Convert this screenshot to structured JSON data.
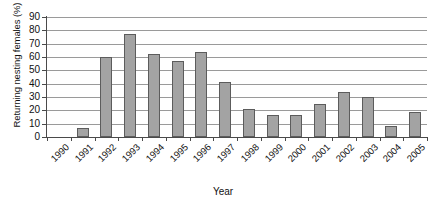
{
  "chart_data": {
    "type": "bar",
    "title": "",
    "xlabel": "Year",
    "ylabel": "Returning nesting females (%)",
    "categories": [
      "1990",
      "1991",
      "1992",
      "1993",
      "1994",
      "1995",
      "1996",
      "1997",
      "1998",
      "1999",
      "2000",
      "2001",
      "2002",
      "2003",
      "2004",
      "2005"
    ],
    "values": [
      0,
      7,
      60,
      77,
      62,
      57,
      63.5,
      41,
      21,
      16.5,
      16.5,
      25,
      33.5,
      30,
      8.5,
      18.5
    ],
    "ylim": [
      0,
      90
    ],
    "ytick_labels": [
      "90",
      "80",
      "70",
      "60",
      "50",
      "40",
      "30",
      "20",
      "10",
      "0"
    ],
    "ytick_values": [
      90,
      80,
      70,
      60,
      50,
      40,
      30,
      20,
      10,
      0
    ],
    "ytick_step": 10,
    "grid": true,
    "legend": false,
    "bar_color": "#a3a3a3",
    "bar_border_color": "#5c5c5c",
    "gridline_color": "#9a9a9a",
    "axis_color": "#4a4a4a",
    "background_color": "#ffffff",
    "xtick_label_rotation": -45
  }
}
